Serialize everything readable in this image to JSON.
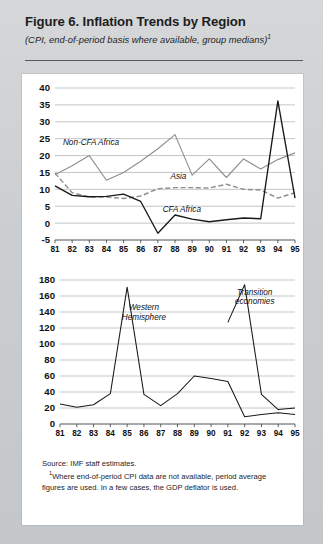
{
  "figure": {
    "title": "Figure 6.  Inflation Trends by Region",
    "subtitle": "(CPI, end-of-period basis where available, group medians)",
    "subtitle_footnote_marker": "1"
  },
  "notes": {
    "source": "Source:  IMF staff estimates.",
    "footnote_marker": "1",
    "footnote": "Where end-of-period CPI data are not available, period average figures are used. In a few cases, the GDP deflator is used."
  },
  "colors": {
    "panel_background": "#ffffff",
    "page_background": "#cccfd1",
    "gridline": "#9b9ea1",
    "gray_series": "#8d9093",
    "black_series": "#18191b",
    "text": "#1d1d1f"
  },
  "chart_data": [
    {
      "type": "line",
      "title": "",
      "xlabel": "",
      "ylabel": "",
      "grid": true,
      "legend": "inline-annotations",
      "x": [
        1981,
        1982,
        1983,
        1984,
        1985,
        1986,
        1987,
        1988,
        1989,
        1990,
        1991,
        1992,
        1993,
        1994,
        1995
      ],
      "categories": [
        "81",
        "82",
        "83",
        "84",
        "85",
        "86",
        "87",
        "88",
        "89",
        "90",
        "91",
        "92",
        "93",
        "94",
        "95"
      ],
      "ylim": [
        -5,
        40
      ],
      "yticks": [
        -5,
        0,
        5,
        10,
        15,
        20,
        25,
        30,
        35,
        40
      ],
      "ytick_labels": [
        "-5",
        "0",
        "5",
        "10",
        "15",
        "20",
        "25",
        "30",
        "35",
        "40"
      ],
      "series": [
        {
          "name": "Non-CFA Africa",
          "style": "solid",
          "color": "#8d9093",
          "values": [
            14.3,
            17.0,
            20.0,
            12.7,
            15.0,
            18.3,
            22.0,
            26.2,
            14.2,
            19.0,
            13.5,
            19.0,
            16.0,
            18.8,
            20.8
          ]
        },
        {
          "name": "Asia",
          "style": "dashed",
          "color": "#8d9093",
          "values": [
            14.8,
            9.0,
            7.7,
            7.7,
            7.3,
            8.0,
            10.2,
            10.5,
            10.5,
            10.4,
            11.5,
            10.0,
            9.8,
            7.4,
            9.0
          ]
        },
        {
          "name": "CFA Africa",
          "style": "solid",
          "color": "#18191b",
          "values": [
            11.0,
            8.2,
            7.8,
            7.9,
            8.6,
            6.4,
            -3.0,
            2.4,
            1.2,
            0.4,
            1.0,
            1.5,
            1.3,
            36.2,
            7.4
          ]
        }
      ],
      "annotations": [
        {
          "text": "Non-CFA Africa",
          "x": 1983.1,
          "y": 23.2
        },
        {
          "text": "Asia",
          "x": 1988.2,
          "y": 13.0
        },
        {
          "text": "CFA Africa",
          "x": 1988.4,
          "y": 3.3
        }
      ]
    },
    {
      "type": "line",
      "title": "",
      "xlabel": "",
      "ylabel": "",
      "grid": true,
      "legend": "inline-annotations",
      "x": [
        1981,
        1982,
        1983,
        1984,
        1985,
        1986,
        1987,
        1988,
        1989,
        1990,
        1991,
        1992,
        1993,
        1994,
        1995
      ],
      "categories": [
        "81",
        "82",
        "83",
        "84",
        "85",
        "86",
        "87",
        "88",
        "89",
        "90",
        "91",
        "92",
        "93",
        "94",
        "95"
      ],
      "ylim": [
        0,
        180
      ],
      "yticks": [
        0,
        20,
        40,
        60,
        80,
        100,
        120,
        140,
        160,
        180
      ],
      "ytick_labels": [
        "0",
        "20",
        "40",
        "60",
        "80",
        "100",
        "120",
        "140",
        "160",
        "180"
      ],
      "series": [
        {
          "name": "Western Hemisphere",
          "style": "solid",
          "color": "#18191b",
          "values": [
            25,
            21,
            24,
            38,
            171,
            37,
            23,
            38,
            60,
            57,
            53,
            9,
            12,
            14,
            12
          ]
        },
        {
          "name": "Transition economies",
          "style": "solid",
          "color": "#18191b",
          "start_year": 1991,
          "values": [
            127,
            174,
            37,
            18,
            20
          ]
        }
      ],
      "annotations": [
        {
          "text": "Western",
          "x": 1986.0,
          "y": 142
        },
        {
          "text": "Hemisphere",
          "x": 1986.0,
          "y": 130
        },
        {
          "text": "Transition",
          "x": 1992.6,
          "y": 161
        },
        {
          "text": "economies",
          "x": 1992.6,
          "y": 150
        }
      ]
    }
  ]
}
